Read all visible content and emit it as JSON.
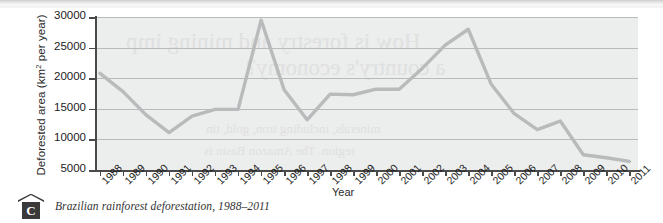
{
  "chart_data": {
    "type": "line",
    "title": "",
    "xlabel": "Year",
    "ylabel": "Deforested area (km2 per year)",
    "ylabel_main": "Deforested area (km",
    "ylabel_sup": "2",
    "ylabel_tail": " per year)",
    "categories": [
      "1988",
      "1989",
      "1990",
      "1991",
      "1992",
      "1993",
      "1994",
      "1995",
      "1996",
      "1997",
      "1998",
      "1999",
      "2000",
      "2001",
      "2002",
      "2003",
      "2004",
      "2005",
      "2006",
      "2007",
      "2008",
      "2009",
      "2010",
      "2011"
    ],
    "values": [
      20800,
      17800,
      14000,
      11100,
      13800,
      14900,
      14900,
      29500,
      18100,
      13200,
      17400,
      17300,
      18200,
      18200,
      21600,
      25400,
      28000,
      19000,
      14200,
      11600,
      13000,
      7500,
      7000,
      6400
    ],
    "series": [
      {
        "name": "Deforested area",
        "color": "#b9babb",
        "values": [
          20800,
          17800,
          14000,
          11100,
          13800,
          14900,
          14900,
          29500,
          18100,
          13200,
          17400,
          17300,
          18200,
          18200,
          21600,
          25400,
          28000,
          19000,
          14200,
          11600,
          13000,
          7500,
          7000,
          6400
        ]
      }
    ],
    "ylim": [
      5000,
      30000
    ],
    "yticks": [
      5000,
      10000,
      15000,
      20000,
      25000,
      30000
    ],
    "ytick_labels": [
      "5000",
      "10000",
      "15000",
      "20000",
      "25000",
      "30000"
    ],
    "grid": true,
    "grid_axis": "y",
    "legend": false,
    "plot_background": "#eceded",
    "line_color": "#b9babb",
    "axis_color": "#4a4a4a"
  },
  "caption": {
    "marker_letter": "C",
    "text": "Brazilian rainforest deforestation, 1988–2011"
  },
  "bleedthrough": {
    "line1": "How is forestry and mining imp",
    "line2": "a country's economy?",
    "line3": "minerals, including iron, gold, tin",
    "line4": "region. The Amazon Basin is"
  }
}
